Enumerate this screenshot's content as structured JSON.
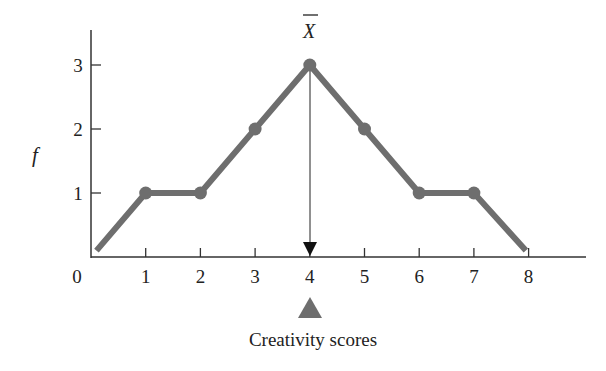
{
  "chart_data": {
    "type": "line",
    "title": "",
    "xlabel": "Creativity scores",
    "ylabel": "f",
    "x": [
      0.1,
      1,
      2,
      3,
      4,
      5,
      6,
      7,
      7.95
    ],
    "series": [
      {
        "name": "frequency polygon",
        "values": [
          0.1,
          1,
          1,
          2,
          3,
          2,
          1,
          1,
          0.1
        ],
        "markers_at_x": [
          1,
          2,
          3,
          4,
          5,
          6,
          7
        ]
      }
    ],
    "xticks": [
      "0",
      "1",
      "2",
      "3",
      "4",
      "5",
      "6",
      "7",
      "8"
    ],
    "yticks": [
      "1",
      "2",
      "3"
    ],
    "xlim": [
      0,
      9.1
    ],
    "ylim": [
      0,
      3.5
    ],
    "grid": false,
    "legend": null,
    "annotations": [
      {
        "label": "X̄",
        "x": 4,
        "description": "mean marker: vertical arrow from peak down to x-axis"
      },
      {
        "shape": "triangle",
        "x": 4,
        "description": "balance-point triangle below x-axis at 4"
      }
    ],
    "colors": {
      "line": "#6e6e6e",
      "axis": "#333333",
      "arrow": "#111111",
      "triangle": "#6e6e6e"
    }
  },
  "labels": {
    "mean": "X",
    "y_axis": "f",
    "x_axis": "Creativity scores"
  }
}
